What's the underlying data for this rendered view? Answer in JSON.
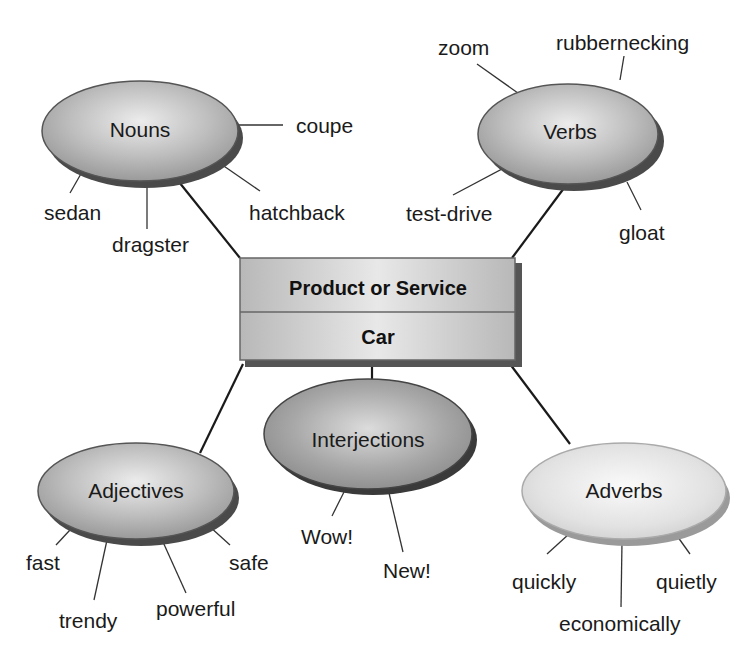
{
  "center": {
    "header": "Product or Service",
    "value": "Car"
  },
  "nodes": {
    "nouns": {
      "label": "Nouns",
      "words": [
        "coupe",
        "sedan",
        "dragster",
        "hatchback"
      ]
    },
    "verbs": {
      "label": "Verbs",
      "words": [
        "zoom",
        "rubbernecking",
        "test-drive",
        "gloat"
      ]
    },
    "interjections": {
      "label": "Interjections",
      "words": [
        "Wow!",
        "New!"
      ]
    },
    "adjectives": {
      "label": "Adjectives",
      "words": [
        "fast",
        "safe",
        "trendy",
        "powerful"
      ]
    },
    "adverbs": {
      "label": "Adverbs",
      "words": [
        "quickly",
        "quietly",
        "economically"
      ]
    }
  },
  "colors": {
    "ellipse_dark": "#8c8c8c",
    "ellipse_light": "#d9d9d9",
    "box_fill": "#c4c4c4",
    "shadow": "#555555",
    "line": "#1a1a1a"
  }
}
